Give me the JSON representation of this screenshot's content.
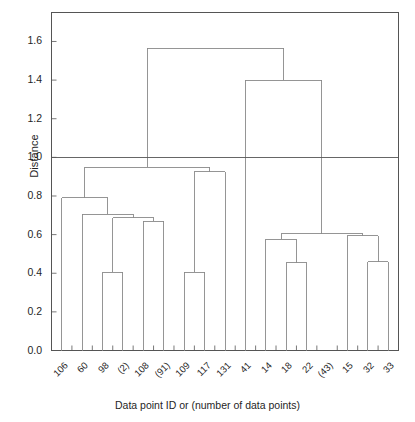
{
  "chart_data": {
    "type": "line",
    "subtype": "dendrogram",
    "title": "",
    "xlabel": "Data point ID or (number of data points)",
    "ylabel": "Distance",
    "ylim": [
      0.0,
      1.75
    ],
    "yticks": [
      "0.0",
      "0.2",
      "0.4",
      "0.6",
      "0.8",
      "1.0",
      "1.2",
      "1.4",
      "1.6"
    ],
    "ytick_values": [
      0.0,
      0.2,
      0.4,
      0.6,
      0.8,
      1.0,
      1.2,
      1.4,
      1.6
    ],
    "grid": false,
    "legend": "none",
    "leaf_labels": [
      "106",
      "60",
      "98",
      "(2)",
      "108",
      "(91)",
      "109",
      "117",
      "131",
      "41",
      "14",
      "18",
      "22",
      "(43)",
      "15",
      "32",
      "33"
    ],
    "threshold_line": {
      "value": 1.0,
      "label": "1.0",
      "color": "#555555"
    },
    "line_color": "#8a8a8a",
    "axis_color": "#555555",
    "merges": [
      {
        "id": "m1",
        "left": "98",
        "right": "(2)",
        "height": 0.405,
        "members": [
          "98",
          "(2)"
        ]
      },
      {
        "id": "m2",
        "left": "108",
        "right": "(91)",
        "height": 0.67,
        "members": [
          "108",
          "(91)"
        ]
      },
      {
        "id": "m3",
        "left": "m1",
        "right": "m2",
        "height": 0.687,
        "members": [
          "98",
          "(2)",
          "108",
          "(91)"
        ]
      },
      {
        "id": "m4",
        "left": "60",
        "right": "m3",
        "height": 0.705,
        "members": [
          "60",
          "98",
          "(2)",
          "108",
          "(91)"
        ]
      },
      {
        "id": "m5",
        "left": "106",
        "right": "m4",
        "height": 0.79,
        "members": [
          "106",
          "60",
          "98",
          "(2)",
          "108",
          "(91)"
        ]
      },
      {
        "id": "m6",
        "left": "109",
        "right": "117",
        "height": 0.405,
        "members": [
          "109",
          "117"
        ]
      },
      {
        "id": "m7",
        "left": "m6",
        "right": "131",
        "height": 0.925,
        "members": [
          "109",
          "117",
          "131"
        ]
      },
      {
        "id": "m8",
        "left": "m5",
        "right": "m7",
        "height": 0.95,
        "members": [
          "106",
          "60",
          "98",
          "(2)",
          "108",
          "(91)",
          "109",
          "117",
          "131"
        ]
      },
      {
        "id": "m9",
        "left": "18",
        "right": "22",
        "height": 0.455,
        "members": [
          "18",
          "22"
        ]
      },
      {
        "id": "m10",
        "left": "14",
        "right": "m9",
        "height": 0.575,
        "members": [
          "14",
          "18",
          "22"
        ]
      },
      {
        "id": "m11",
        "left": "32",
        "right": "33",
        "height": 0.46,
        "members": [
          "32",
          "33"
        ]
      },
      {
        "id": "m12",
        "left": "15",
        "right": "m11",
        "height": 0.595,
        "members": [
          "15",
          "32",
          "33"
        ]
      },
      {
        "id": "m13",
        "left": "m10",
        "right": "m12",
        "height": 0.605,
        "members": [
          "14",
          "18",
          "22",
          "(43)",
          "15",
          "32",
          "33"
        ]
      },
      {
        "id": "m14",
        "left": "41",
        "right": "m13",
        "height": 1.4,
        "members": [
          "41",
          "14",
          "18",
          "22",
          "(43)",
          "15",
          "32",
          "33"
        ]
      },
      {
        "id": "m15",
        "left": "m8",
        "right": "m14",
        "height": 1.565,
        "members": [
          "all"
        ]
      }
    ]
  }
}
